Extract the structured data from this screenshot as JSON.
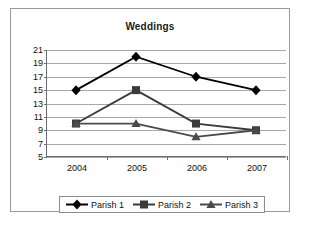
{
  "chart_data": {
    "type": "line",
    "title": "Weddings",
    "xlabel": "",
    "ylabel": "",
    "categories": [
      "2004",
      "2005",
      "2006",
      "2007"
    ],
    "series": [
      {
        "name": "Parish 1",
        "marker": "diamond",
        "color": "#000000",
        "values": [
          15,
          20,
          17,
          15
        ]
      },
      {
        "name": "Parish 2",
        "marker": "square",
        "color": "#3b3b3b",
        "values": [
          10,
          15,
          10,
          9
        ]
      },
      {
        "name": "Parish 3",
        "marker": "triangle",
        "color": "#4a4a4a",
        "values": [
          10,
          10,
          8,
          9
        ]
      }
    ],
    "yticks": [
      21,
      19,
      17,
      15,
      13,
      11,
      9,
      7,
      5
    ],
    "ylim": [
      5,
      21
    ],
    "grid": true,
    "legend_position": "bottom"
  }
}
